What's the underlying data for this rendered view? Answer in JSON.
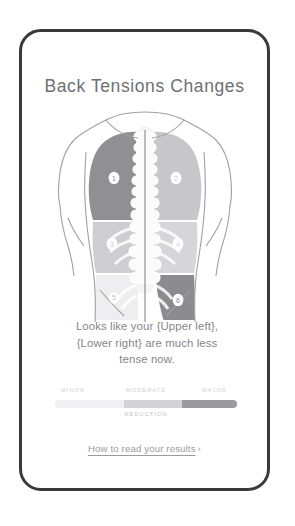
{
  "card": {
    "title": "Back Tensions Changes",
    "border_color": "#3a3a3c",
    "background": "#ffffff"
  },
  "body_map": {
    "alt": "back-tension-heatmap",
    "skin_color": "#ffffff",
    "outline_color": "#9b9ba0",
    "spine_color": "#f2f2f4",
    "spine_line_color": "#6e6e73",
    "zones": [
      {
        "id": 1,
        "label": "1",
        "name": "upper-left",
        "intensity": "major",
        "color": "#8f8f94",
        "label_color": "#ffffff"
      },
      {
        "id": 2,
        "label": "2",
        "name": "upper-right",
        "intensity": "moderate",
        "color": "#c6c6cb",
        "label_color": "#ffffff"
      },
      {
        "id": 3,
        "label": "3",
        "name": "mid-left",
        "intensity": "moderate",
        "color": "#cdcdd2",
        "label_color": "#ffffff"
      },
      {
        "id": 4,
        "label": "4",
        "name": "mid-right",
        "intensity": "moderate",
        "color": "#d6d6da",
        "label_color": "#ffffff"
      },
      {
        "id": 5,
        "label": "5",
        "name": "lower-left",
        "intensity": "minor",
        "color": "#eeeef0",
        "label_color": "#b9b9be"
      },
      {
        "id": 6,
        "label": "6",
        "name": "lower-right",
        "intensity": "major",
        "color": "#8b8b90",
        "label_color": "#ffffff"
      }
    ]
  },
  "summary": {
    "line1": "Looks like your {Upper left},",
    "line2": "{Lower right} are much less",
    "line3": "tense now."
  },
  "legend": {
    "labels": [
      "MINOR",
      "MODERATE",
      "MAJOR"
    ],
    "caption": "REDUCTION",
    "segments": [
      {
        "label": "MINOR",
        "color": "#f0f0f2"
      },
      {
        "label": "MODERATE",
        "color": "#d3d3d7"
      },
      {
        "label": "MAJOR",
        "color": "#9a9a9f"
      }
    ]
  },
  "footer": {
    "link_label": "How to read your results",
    "chevron": "›"
  }
}
